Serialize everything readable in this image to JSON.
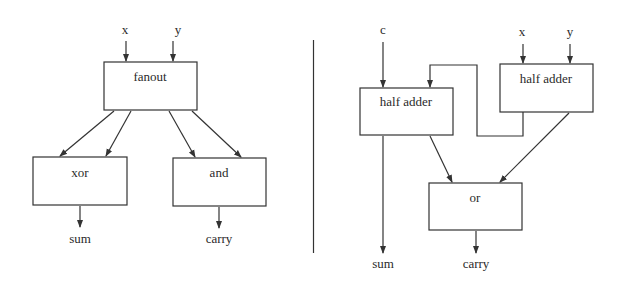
{
  "diagram": {
    "left": {
      "title": "half adder",
      "inputs": [
        "x",
        "y"
      ],
      "blocks": {
        "fanout": "fanout",
        "xor": "xor",
        "and": "and"
      },
      "outputs": [
        "sum",
        "carry"
      ]
    },
    "right": {
      "title": "full adder",
      "inputs": [
        "c",
        "x",
        "y"
      ],
      "blocks": {
        "half_adder_1": "half adder",
        "half_adder_2": "half adder",
        "or": "or"
      },
      "outputs": [
        "sum",
        "carry"
      ]
    },
    "colors": {
      "stroke": "#333333",
      "text": "#2a2a2a",
      "background": "#ffffff"
    }
  }
}
